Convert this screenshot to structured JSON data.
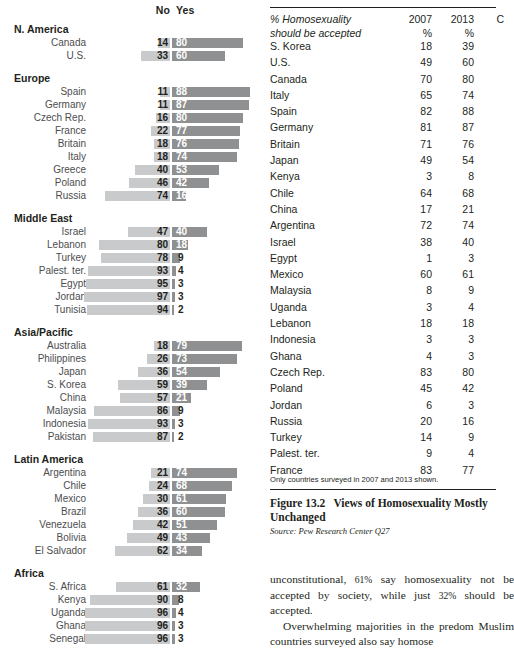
{
  "chart_data": {
    "type": "bar",
    "subtype": "diverging-stacked-bar",
    "title": "Views of Homosexuality",
    "xlabel": "",
    "ylabel": "",
    "legend": [
      "No",
      "Yes"
    ],
    "legend_position": "top",
    "grid": false,
    "xlim": [
      0,
      100
    ],
    "colors": {
      "no": "#c9cacb",
      "yes": "#8e9091"
    },
    "headers": {
      "no": "No",
      "yes": "Yes"
    },
    "groups": [
      {
        "name": "N. America",
        "rows": [
          {
            "label": "Canada",
            "no": 14,
            "yes": 80
          },
          {
            "label": "U.S.",
            "no": 33,
            "yes": 60
          }
        ]
      },
      {
        "name": "Europe",
        "rows": [
          {
            "label": "Spain",
            "no": 11,
            "yes": 88
          },
          {
            "label": "Germany",
            "no": 11,
            "yes": 87
          },
          {
            "label": "Czech Rep.",
            "no": 16,
            "yes": 80
          },
          {
            "label": "France",
            "no": 22,
            "yes": 77
          },
          {
            "label": "Britain",
            "no": 18,
            "yes": 76
          },
          {
            "label": "Italy",
            "no": 18,
            "yes": 74
          },
          {
            "label": "Greece",
            "no": 40,
            "yes": 53
          },
          {
            "label": "Poland",
            "no": 46,
            "yes": 42
          },
          {
            "label": "Russia",
            "no": 74,
            "yes": 16
          }
        ]
      },
      {
        "name": "Middle East",
        "rows": [
          {
            "label": "Israel",
            "no": 47,
            "yes": 40
          },
          {
            "label": "Lebanon",
            "no": 80,
            "yes": 18
          },
          {
            "label": "Turkey",
            "no": 78,
            "yes": 9
          },
          {
            "label": "Palest. ter.",
            "no": 93,
            "yes": 4
          },
          {
            "label": "Egypt",
            "no": 95,
            "yes": 3
          },
          {
            "label": "Jordan",
            "no": 97,
            "yes": 3
          },
          {
            "label": "Tunisia",
            "no": 94,
            "yes": 2
          }
        ]
      },
      {
        "name": "Asia/Pacific",
        "rows": [
          {
            "label": "Australia",
            "no": 18,
            "yes": 79
          },
          {
            "label": "Philippines",
            "no": 26,
            "yes": 73
          },
          {
            "label": "Japan",
            "no": 36,
            "yes": 54
          },
          {
            "label": "S. Korea",
            "no": 59,
            "yes": 39
          },
          {
            "label": "China",
            "no": 57,
            "yes": 21
          },
          {
            "label": "Malaysia",
            "no": 86,
            "yes": 9
          },
          {
            "label": "Indonesia",
            "no": 93,
            "yes": 3
          },
          {
            "label": "Pakistan",
            "no": 87,
            "yes": 2
          }
        ]
      },
      {
        "name": "Latin America",
        "rows": [
          {
            "label": "Argentina",
            "no": 21,
            "yes": 74
          },
          {
            "label": "Chile",
            "no": 24,
            "yes": 68
          },
          {
            "label": "Mexico",
            "no": 30,
            "yes": 61
          },
          {
            "label": "Brazil",
            "no": 36,
            "yes": 60
          },
          {
            "label": "Venezuela",
            "no": 42,
            "yes": 51
          },
          {
            "label": "Bolivia",
            "no": 49,
            "yes": 43
          },
          {
            "label": "El Salvador",
            "no": 62,
            "yes": 34
          }
        ]
      },
      {
        "name": "Africa",
        "rows": [
          {
            "label": "S. Africa",
            "no": 61,
            "yes": 32
          },
          {
            "label": "Kenya",
            "no": 90,
            "yes": 8
          },
          {
            "label": "Uganda",
            "no": 96,
            "yes": 4
          },
          {
            "label": "Ghana",
            "no": 96,
            "yes": 3
          },
          {
            "label": "Senegal",
            "no": 96,
            "yes": 3
          }
        ]
      }
    ]
  },
  "table": {
    "header": {
      "label_line1": "% Homosexuality",
      "label_line2": "should be accepted",
      "col_2007": "2007",
      "col_2013": "2013",
      "col_change": "C",
      "pct_2007": "%",
      "pct_2013": "%"
    },
    "rows": [
      {
        "country": "S. Korea",
        "y2007": "18",
        "y2013": "39"
      },
      {
        "country": "U.S.",
        "y2007": "49",
        "y2013": "60"
      },
      {
        "country": "Canada",
        "y2007": "70",
        "y2013": "80"
      },
      {
        "country": "Italy",
        "y2007": "65",
        "y2013": "74"
      },
      {
        "country": "Spain",
        "y2007": "82",
        "y2013": "88"
      },
      {
        "country": "Germany",
        "y2007": "81",
        "y2013": "87"
      },
      {
        "country": "Britain",
        "y2007": "71",
        "y2013": "76"
      },
      {
        "country": "Japan",
        "y2007": "49",
        "y2013": "54"
      },
      {
        "country": "Kenya",
        "y2007": "3",
        "y2013": "8"
      },
      {
        "country": "Chile",
        "y2007": "64",
        "y2013": "68"
      },
      {
        "country": "China",
        "y2007": "17",
        "y2013": "21"
      },
      {
        "country": "Argentina",
        "y2007": "72",
        "y2013": "74"
      },
      {
        "country": "Israel",
        "y2007": "38",
        "y2013": "40"
      },
      {
        "country": "Egypt",
        "y2007": "1",
        "y2013": "3"
      },
      {
        "country": "Mexico",
        "y2007": "60",
        "y2013": "61"
      },
      {
        "country": "Malaysia",
        "y2007": "8",
        "y2013": "9"
      },
      {
        "country": "Uganda",
        "y2007": "3",
        "y2013": "4"
      },
      {
        "country": "Lebanon",
        "y2007": "18",
        "y2013": "18"
      },
      {
        "country": "Indonesia",
        "y2007": "3",
        "y2013": "3"
      },
      {
        "country": "Ghana",
        "y2007": "4",
        "y2013": "3"
      },
      {
        "country": "Czech Rep.",
        "y2007": "83",
        "y2013": "80"
      },
      {
        "country": "Poland",
        "y2007": "45",
        "y2013": "42"
      },
      {
        "country": "Jordan",
        "y2007": "6",
        "y2013": "3"
      },
      {
        "country": "Russia",
        "y2007": "20",
        "y2013": "16"
      },
      {
        "country": "Turkey",
        "y2007": "14",
        "y2013": "9"
      },
      {
        "country": "Palest. ter.",
        "y2007": "9",
        "y2013": "4"
      },
      {
        "country": "France",
        "y2007": "83",
        "y2013": "77"
      }
    ],
    "note": "Only countries surveyed in 2007 and 2013 shown."
  },
  "figure": {
    "number": "Figure 13.2",
    "title_line1": "Views of Homosexuality Mostly",
    "title_line2": "Unchanged",
    "source": "Source: Pew Research Center Q27"
  },
  "body": {
    "para1_a": "unconstitutional, ",
    "para1_pct1": "61%",
    "para1_b": " say homosexuality",
    "para1_c": "not be accepted by society, while just ",
    "para1_pct2": "32%",
    "para1_d": "should be accepted.",
    "para2_a": "Overwhelming majorities in the predom",
    "para2_b": "Muslim countries surveyed also say homose"
  }
}
